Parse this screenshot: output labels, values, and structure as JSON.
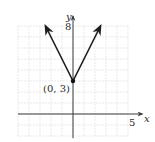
{
  "chart_data": {
    "type": "line",
    "title": "",
    "function": "y = 2|x| + 3",
    "series": [
      {
        "name": "absolute-value-graph",
        "points": [
          [
            -2.5,
            8
          ],
          [
            0,
            3
          ],
          [
            2.5,
            8
          ]
        ],
        "arrows_at_ends": true
      }
    ],
    "vertex": {
      "x": 0,
      "y": 3,
      "label": "(0, 3)"
    },
    "xlabel": "x",
    "ylabel": "y",
    "xlim": [
      -5,
      5
    ],
    "ylim": [
      -2,
      8
    ],
    "x_tick_labels": [
      {
        "value": 5,
        "label": "5"
      }
    ],
    "y_tick_labels": [
      {
        "value": 8,
        "label": "8"
      }
    ],
    "grid": true,
    "grid_step": 1
  }
}
